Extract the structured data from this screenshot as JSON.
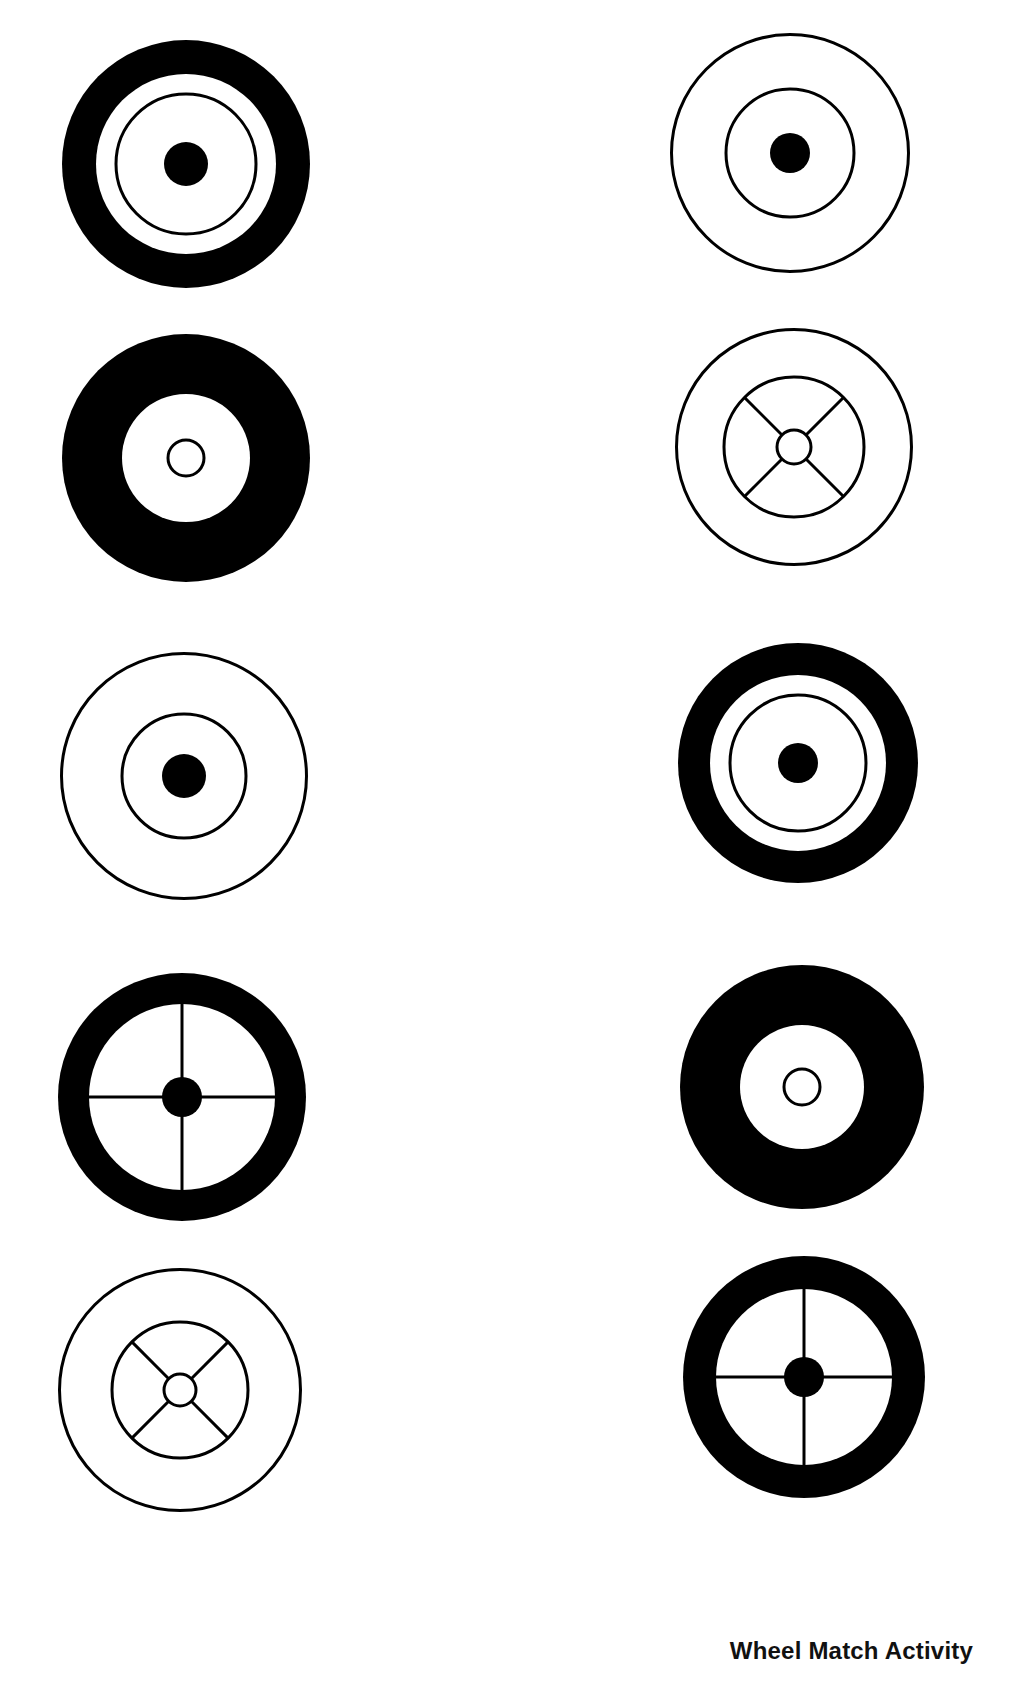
{
  "page": {
    "caption": "Wheel Match Activity",
    "ink_color": "#000000",
    "paper_color": "#ffffff"
  },
  "wheels": [
    {
      "id": "L1",
      "column": "left",
      "row": 1,
      "style": "thick-tire-ring-solid-hub",
      "cx": 186,
      "cy": 164,
      "r": 124,
      "white_r": 90,
      "ring_r": 70,
      "hub": "solid",
      "hub_r": 22,
      "spokes": "none"
    },
    {
      "id": "L2",
      "column": "left",
      "row": 2,
      "style": "wide-tire-open-hub",
      "cx": 186,
      "cy": 458,
      "r": 124,
      "white_r": 64,
      "ring_r": 0,
      "hub": "open",
      "hub_r": 18,
      "spokes": "none"
    },
    {
      "id": "L3",
      "column": "left",
      "row": 3,
      "style": "outline-ring-solid-hub",
      "cx": 184,
      "cy": 776,
      "r": 124,
      "white_r": 0,
      "ring_r": 62,
      "hub": "solid",
      "hub_r": 22,
      "spokes": "none"
    },
    {
      "id": "L4",
      "column": "left",
      "row": 4,
      "style": "tire-cross-spokes-solid-hub",
      "cx": 182,
      "cy": 1097,
      "r": 124,
      "white_r": 93,
      "ring_r": 0,
      "hub": "solid",
      "hub_r": 20,
      "spokes": "cross"
    },
    {
      "id": "L5",
      "column": "left",
      "row": 5,
      "style": "outline-diagonal-spokes-open-hub",
      "cx": 180,
      "cy": 1390,
      "r": 122,
      "white_r": 0,
      "ring_r": 68,
      "hub": "open",
      "hub_r": 16,
      "spokes": "diagonal"
    },
    {
      "id": "R1",
      "column": "right",
      "row": 1,
      "style": "outline-ring-solid-hub",
      "cx": 790,
      "cy": 153,
      "r": 120,
      "white_r": 0,
      "ring_r": 64,
      "hub": "solid",
      "hub_r": 20,
      "spokes": "none"
    },
    {
      "id": "R2",
      "column": "right",
      "row": 2,
      "style": "outline-diagonal-spokes-open-hub",
      "cx": 794,
      "cy": 447,
      "r": 119,
      "white_r": 0,
      "ring_r": 70,
      "hub": "open",
      "hub_r": 17,
      "spokes": "diagonal"
    },
    {
      "id": "R3",
      "column": "right",
      "row": 3,
      "style": "thick-tire-ring-solid-hub",
      "cx": 798,
      "cy": 763,
      "r": 120,
      "white_r": 88,
      "ring_r": 68,
      "hub": "solid",
      "hub_r": 20,
      "spokes": "none"
    },
    {
      "id": "R4",
      "column": "right",
      "row": 4,
      "style": "wide-tire-open-hub",
      "cx": 802,
      "cy": 1087,
      "r": 122,
      "white_r": 62,
      "ring_r": 0,
      "hub": "open",
      "hub_r": 18,
      "spokes": "none"
    },
    {
      "id": "R5",
      "column": "right",
      "row": 5,
      "style": "tire-cross-spokes-solid-hub",
      "cx": 804,
      "cy": 1377,
      "r": 121,
      "white_r": 88,
      "ring_r": 0,
      "hub": "solid",
      "hub_r": 20,
      "spokes": "cross"
    }
  ]
}
